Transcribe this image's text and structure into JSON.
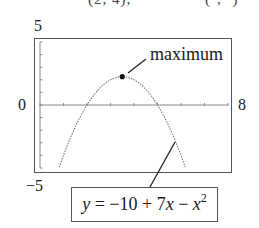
{
  "clipped_header": {
    "left": "(2, 4),",
    "right": "(·, ·)"
  },
  "chart_data": {
    "type": "line",
    "title": "",
    "function": "y = -10 + 7x - x^2",
    "xlabel": "",
    "ylabel": "",
    "xlim": [
      0,
      8
    ],
    "ylim": [
      -5,
      5
    ],
    "x_ticks": [
      0,
      1,
      2,
      3,
      4,
      5,
      6,
      7,
      8
    ],
    "y_ticks": [
      -5,
      -4,
      -3,
      -2,
      -1,
      0,
      1,
      2,
      3,
      4,
      5
    ],
    "grid": false,
    "line_style": "dotted",
    "series": [
      {
        "name": "y = -10 + 7x - x^2",
        "x": [
          0.81,
          1,
          1.5,
          2,
          2.5,
          3,
          3.5,
          4,
          4.5,
          5,
          5.5,
          6,
          6.19
        ],
        "y": [
          -5,
          -4,
          -1.75,
          0,
          1.25,
          2,
          2.25,
          2,
          1.25,
          0,
          -1.75,
          -4,
          -5
        ]
      }
    ],
    "annotations": [
      {
        "text": "maximum",
        "point": [
          3.5,
          2.25
        ]
      },
      {
        "text": "y = −10 + 7x − x²",
        "points_to": "curve"
      }
    ],
    "window_labels": {
      "ymax": "5",
      "ymin": "−5",
      "xmin": "0",
      "xmax": "8"
    }
  },
  "labels": {
    "ymax": "5",
    "ymin": "−5",
    "xmin": "0",
    "xmax": "8",
    "maximum": "maximum",
    "formula_y": "y",
    "formula_mid": " = −10 + 7",
    "formula_x": "x",
    "formula_minus": " − ",
    "formula_x2": "x",
    "formula_exp": "2"
  }
}
